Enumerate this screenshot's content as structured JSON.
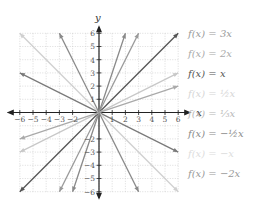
{
  "chart_data": {
    "type": "line",
    "title": "",
    "xlabel": "x",
    "ylabel": "y",
    "xlim": [
      -6,
      6
    ],
    "ylim": [
      -6,
      6
    ],
    "grid": true,
    "grid_style": "dotted",
    "x_ticks": [
      -6,
      -5,
      -4,
      -3,
      -2,
      1,
      2,
      3,
      4,
      5,
      6
    ],
    "y_ticks": [
      6,
      5,
      4,
      3,
      2,
      1,
      -2,
      -3,
      -4,
      -5,
      -6
    ],
    "legend_position": "right",
    "series": [
      {
        "name": "f(x) = 3x",
        "slope": 3,
        "color": "#8a8a8a",
        "x": [
          -2,
          2
        ],
        "y": [
          -6,
          6
        ]
      },
      {
        "name": "f(x) = 2x",
        "slope": 2,
        "color": "#9a9a9a",
        "x": [
          -3,
          3
        ],
        "y": [
          -6,
          6
        ]
      },
      {
        "name": "f(x) = x",
        "slope": 1,
        "color": "#555555",
        "x": [
          -6,
          6
        ],
        "y": [
          -6,
          6
        ]
      },
      {
        "name": "f(x) = 1/2 x",
        "slope": 0.5,
        "color": "#c8c8c8",
        "x": [
          -6,
          6
        ],
        "y": [
          -3,
          3
        ]
      },
      {
        "name": "f(x) = 1/3 x",
        "slope": 0.3333,
        "color": "#aaaaaa",
        "x": [
          -6,
          6
        ],
        "y": [
          -2,
          2
        ]
      },
      {
        "name": "f(x) = -1/2 x",
        "slope": -0.5,
        "color": "#7a7a7a",
        "x": [
          -6,
          6
        ],
        "y": [
          3,
          -3
        ]
      },
      {
        "name": "f(x) = -x",
        "slope": -1,
        "color": "#d0d0d0",
        "x": [
          -6,
          6
        ],
        "y": [
          6,
          -6
        ]
      },
      {
        "name": "f(x) = -2x",
        "slope": -2,
        "color": "#8a8a8a",
        "x": [
          -3,
          3
        ],
        "y": [
          6,
          -6
        ]
      }
    ]
  },
  "axes": {
    "x_label": "x",
    "y_label": "y"
  },
  "legend": [
    {
      "label": "f(x) = 3x",
      "color": "#9a9a9a"
    },
    {
      "label": "f(x) = 2x",
      "color": "#aaaaaa"
    },
    {
      "label": "f(x) = x",
      "color": "#555555"
    },
    {
      "label": "f(x) = ½x",
      "color": "#d6d6d6"
    },
    {
      "label": "f(x) = ⅓x",
      "color": "#b8b8b8"
    },
    {
      "label": "f(x) = −½x",
      "color": "#8a8a8a"
    },
    {
      "label": "f(x) = −x",
      "color": "#dddddd"
    },
    {
      "label": "f(x) = −2x",
      "color": "#999999"
    }
  ]
}
